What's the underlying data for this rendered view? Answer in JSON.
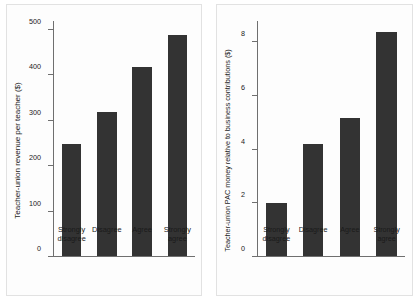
{
  "figure": {
    "background": "#ffffff",
    "bar_color": "#333333",
    "axis_color": "#6f6f6f"
  },
  "chart_data": [
    {
      "type": "bar",
      "panel": "left",
      "title": "",
      "xlabel": "",
      "ylabel": "Teacher-union revenue per teacher ($)",
      "categories": [
        "Strongly disagree",
        "Disagree",
        "Agree",
        "Strongly agree"
      ],
      "values": [
        248,
        318,
        418,
        490
      ],
      "ylim": [
        0,
        520
      ],
      "yticks": [
        0,
        100,
        200,
        300,
        400,
        500
      ],
      "ytick_labels": [
        "0",
        "100",
        "200",
        "300",
        "400",
        "500"
      ],
      "grid": false,
      "legend": "none"
    },
    {
      "type": "bar",
      "panel": "right",
      "title": "",
      "xlabel": "",
      "ylabel": "Teacher-union PAC money relative to business contributions ($)",
      "categories": [
        "Strongly disagree",
        "Disagree",
        "Agree",
        "Strongly agree"
      ],
      "values": [
        2.0,
        4.2,
        5.15,
        8.4
      ],
      "ylim": [
        0,
        8.8
      ],
      "yticks": [
        0,
        2,
        4,
        6,
        8
      ],
      "ytick_labels": [
        "0",
        "2",
        "4",
        "6",
        "8"
      ],
      "grid": false,
      "legend": "none"
    }
  ]
}
